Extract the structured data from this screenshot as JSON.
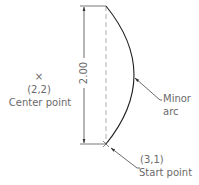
{
  "diagram": {
    "type": "arc-construction",
    "dimension": {
      "label": "2.00",
      "orientation": "vertical"
    },
    "center_point": {
      "marker": "×",
      "coords": "(2,2)",
      "label": "Center point"
    },
    "start_point": {
      "coords": "(3,1)",
      "label": "Start point"
    },
    "arc": {
      "label_line1": "Minor",
      "label_line2": "arc"
    },
    "colors": {
      "line": "#333333",
      "text": "#6a6a6a",
      "dashed": "#9a9a9a"
    }
  }
}
